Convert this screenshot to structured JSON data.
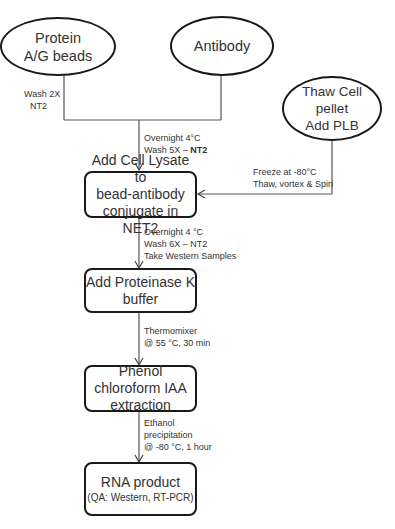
{
  "diagram": {
    "type": "flowchart",
    "nodes": {
      "protein_beads": {
        "line1": "Protein",
        "line2": "A/G beads",
        "shape": "ellipse"
      },
      "antibody": {
        "line1": "Antibody",
        "shape": "ellipse"
      },
      "thaw_cell": {
        "line1": "Thaw Cell",
        "line2": "pellet",
        "line3": "Add PLB",
        "shape": "ellipse"
      },
      "add_lysate": {
        "line1": "Add Cell Lysate to",
        "line2": "bead-antibody",
        "line3": "conjugate in NET2",
        "shape": "rounded-box"
      },
      "proteinase_k": {
        "line1": "Add Proteinase K",
        "line2": "buffer",
        "shape": "rounded-box"
      },
      "phenol": {
        "line1": "Phenol",
        "line2": "chloroform IAA",
        "line3": "extraction",
        "shape": "rounded-box"
      },
      "rna_product": {
        "line1": "RNA product",
        "line2": "(QA: Western, RT-PCR)",
        "shape": "rounded-box"
      }
    },
    "edge_labels": {
      "beads_wash": {
        "line1": "Wash 2X",
        "line2": "NT2"
      },
      "to_lysate": {
        "line1": "Overnight  4°C",
        "line2_prefix": "Wash 5X – ",
        "line2_bold": "NT2"
      },
      "thaw_to_lysate": {
        "line1": "Freeze at  -80°C",
        "line2": "Thaw, vortex & Spin"
      },
      "lysate_to_proteinase": {
        "line1": "Overnight  4 °C",
        "line2": "Wash 6X – NT2",
        "line3": "Take Western Samples"
      },
      "proteinase_to_phenol": {
        "line1": "Thermomixer",
        "line2": "@ 55 °C, 30 min"
      },
      "phenol_to_rna": {
        "line1": "Ethanol",
        "line2": "precipitation",
        "line3": "@ -80 °C,  1 hour"
      }
    },
    "colors": {
      "stroke": "#1a1a1a",
      "text": "#333333",
      "background": "#ffffff"
    }
  }
}
